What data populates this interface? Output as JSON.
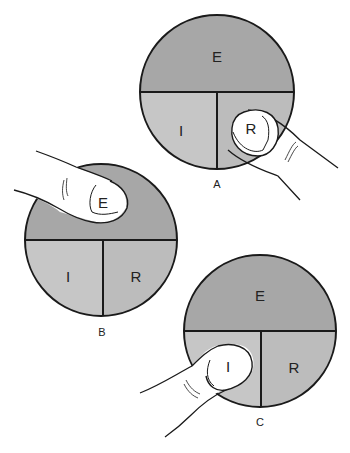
{
  "colors": {
    "e_region": "#a7a7a7",
    "i_region": "#c6c6c6",
    "r_region": "#bcbcbc",
    "outline": "#1a1a1a",
    "finger_fill": "#ffffff"
  },
  "panels": [
    {
      "caption": "A",
      "top_label": "E",
      "left_label": "I",
      "right_label": "R",
      "finger_on": "R"
    },
    {
      "caption": "B",
      "top_label": "E",
      "left_label": "I",
      "right_label": "R",
      "finger_on": "E"
    },
    {
      "caption": "C",
      "top_label": "E",
      "left_label": "I",
      "right_label": "R",
      "finger_on": "I"
    }
  ]
}
